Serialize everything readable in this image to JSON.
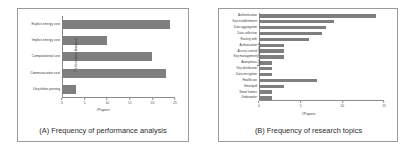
{
  "figure_a": {
    "caption": "(A) Frequency of performance analysis",
    "xlabel": "#Papers",
    "ylabel": "Performance Analysis"
  },
  "figure_b": {
    "caption": "(B) Frequency of research topics",
    "xlabel": "#Papers",
    "ylabel": "Topic Research"
  },
  "colors": {
    "bar": "#7f7f7f",
    "axis": "#8d8d8d",
    "frame": "#9a9a9a",
    "text": "#3a3a3a"
  },
  "chart_data": [
    {
      "type": "bar",
      "orientation": "horizontal",
      "title": "(A) Frequency of performance analysis",
      "xlabel": "#Papers",
      "ylabel": "Performance Analysis",
      "xlim": [
        0,
        25
      ],
      "xticks": [
        0,
        5,
        10,
        15,
        20,
        25
      ],
      "grid": false,
      "legend": "none",
      "categories": [
        "Explicit energy cost",
        "Implicit energy cost",
        "Computational cost",
        "Communication cost",
        "Unq tirbse proving"
      ],
      "values": [
        24,
        10,
        20,
        23,
        3
      ]
    },
    {
      "type": "bar",
      "orientation": "horizontal",
      "title": "(B) Frequency of research topics",
      "xlabel": "#Papers",
      "ylabel": "Topic Research",
      "xlim": [
        0,
        15
      ],
      "xticks": [
        0,
        5,
        10,
        15
      ],
      "grid": false,
      "legend": "none",
      "categories": [
        "Authentication",
        "Key establishment",
        "Data aggregation",
        "Data collection",
        "Routing with",
        "Authorization",
        "Access control",
        "Key management",
        "Anonymous",
        "Key distribution",
        "Data encryption",
        "Healthcare",
        "Smartgrid",
        "Smart homes",
        "Underwater"
      ],
      "values": [
        14,
        9,
        8,
        7.5,
        6,
        3,
        3,
        3,
        1.5,
        1.5,
        1.5,
        7,
        3,
        1.5,
        1.5
      ]
    }
  ]
}
